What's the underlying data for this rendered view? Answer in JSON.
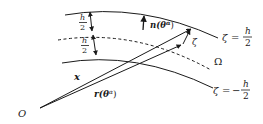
{
  "diagram": {
    "surfaces": {
      "top": {
        "label_lhs": "ζ",
        "label_eq": "=",
        "label_num": "h",
        "label_den": "2"
      },
      "mid": {
        "label": "Ω"
      },
      "bottom": {
        "label_lhs": "ζ",
        "label_eq": "=",
        "label_sign": "−",
        "label_num": "h",
        "label_den": "2"
      }
    },
    "thickness_marks": [
      {
        "num": "h",
        "den": "2"
      },
      {
        "num": "h",
        "den": "2"
      }
    ],
    "vectors": {
      "x": {
        "label": "x"
      },
      "r": {
        "label": "r(θ",
        "sup": "α",
        "close": ")"
      },
      "n": {
        "label": "n(θ",
        "sup": "α",
        "close": ")"
      },
      "zeta": {
        "label": "ζ"
      }
    },
    "origin": {
      "label": "O"
    },
    "colors": {
      "ink": "#1a1a1a",
      "background": "#ffffff"
    }
  }
}
